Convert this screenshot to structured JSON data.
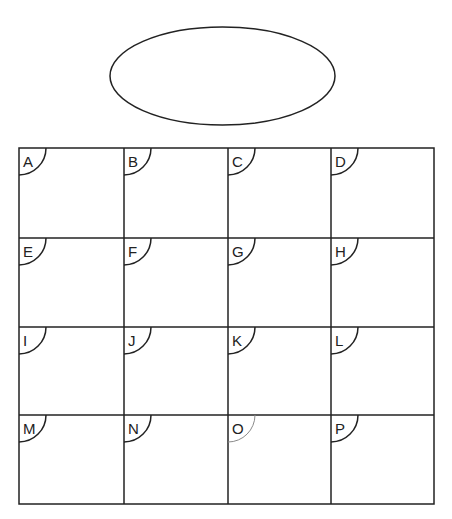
{
  "diagram": {
    "ellipse": {
      "label": ""
    },
    "grid": {
      "rows": 4,
      "cols": 4,
      "cells": [
        {
          "label": "A",
          "highlight": false
        },
        {
          "label": "B",
          "highlight": false
        },
        {
          "label": "C",
          "highlight": false
        },
        {
          "label": "D",
          "highlight": false
        },
        {
          "label": "E",
          "highlight": false
        },
        {
          "label": "F",
          "highlight": false
        },
        {
          "label": "G",
          "highlight": false
        },
        {
          "label": "H",
          "highlight": false
        },
        {
          "label": "I",
          "highlight": false
        },
        {
          "label": "J",
          "highlight": false
        },
        {
          "label": "K",
          "highlight": false
        },
        {
          "label": "L",
          "highlight": false
        },
        {
          "label": "M",
          "highlight": false
        },
        {
          "label": "N",
          "highlight": false
        },
        {
          "label": "O",
          "highlight": true
        },
        {
          "label": "P",
          "highlight": false
        }
      ]
    },
    "colors": {
      "stroke": "#222222",
      "light_stroke": "#8a8a8a",
      "background": "#ffffff"
    }
  }
}
